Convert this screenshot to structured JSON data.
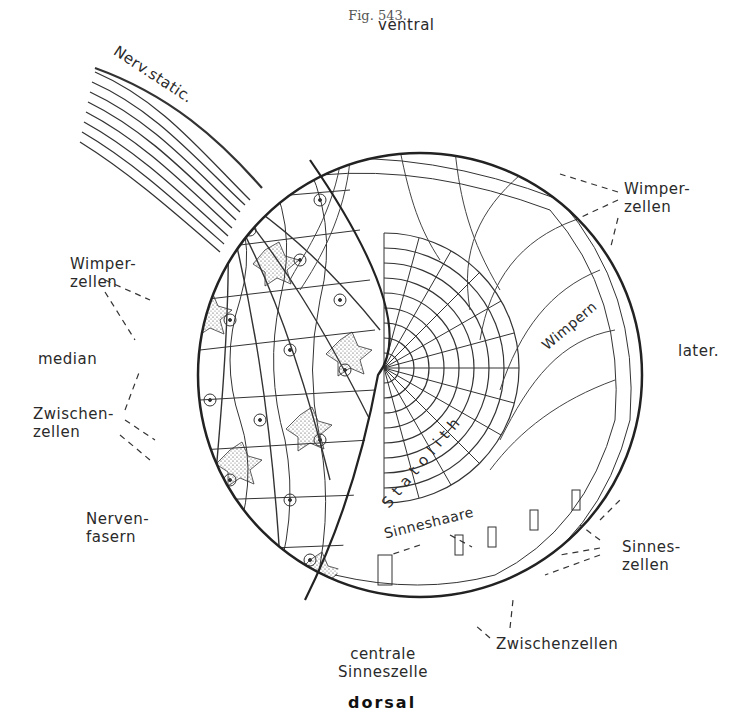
{
  "figure": {
    "caption": "Fig. 543.",
    "orientation_labels": {
      "top": "ventral",
      "bottom": "dorsal",
      "left": "median",
      "right": "later."
    },
    "labels": {
      "nerve": "Nerv.static.",
      "wimperzellen_right": "Wimper-\nzellen",
      "wimperzellen_left": "Wimper-\nzellen",
      "zwischenzellen_left": "Zwischen-\nzellen",
      "nervenfasern": "Nerven-\nfasern",
      "wimpern": "Wimpern",
      "statolith": "Statolith",
      "sinneshaare": "Sinneshaare",
      "sinneszellen": "Sinnes-\nzellen",
      "zwischenzellen_bottom": "Zwischenzellen",
      "centrale_sinneszelle": "centrale\nSinneszelle"
    },
    "colors": {
      "ink": "#2a2a2a",
      "paper": "#ffffff",
      "caption": "#555555"
    }
  }
}
